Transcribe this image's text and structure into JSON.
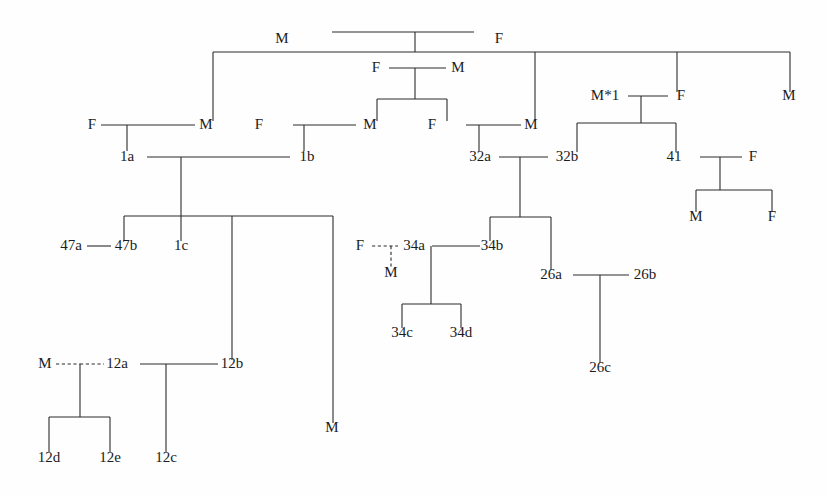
{
  "chart_data": {
    "type": "diagram",
    "diagram_kind": "pedigree-chart",
    "title": "",
    "background_color": "#fefefe",
    "line_color": "#2b2b2b",
    "text_color": "#1c1c1c",
    "legend": {
      "solid_line": "marriage / descent",
      "dashed_line": "non-marital or inferred union"
    },
    "nodes": [
      {
        "id": "n_g1_m",
        "label": "M",
        "x": 282,
        "y": 43,
        "generation": 1
      },
      {
        "id": "n_g1_f",
        "label": "F",
        "x": 499,
        "y": 43,
        "generation": 1
      },
      {
        "id": "n_g2_f_mid",
        "label": "F",
        "x": 376,
        "y": 72,
        "generation": 2
      },
      {
        "id": "n_g2_m_mid",
        "label": "M",
        "x": 458,
        "y": 72,
        "generation": 2
      },
      {
        "id": "n_g2_mstar",
        "label": "M*1",
        "x": 605,
        "y": 100,
        "generation": 2
      },
      {
        "id": "n_g2_f_r",
        "label": "F",
        "x": 681,
        "y": 100,
        "generation": 2
      },
      {
        "id": "n_g2_m_far",
        "label": "M",
        "x": 789,
        "y": 100,
        "generation": 2
      },
      {
        "id": "n_g3_f_a",
        "label": "F",
        "x": 92,
        "y": 129,
        "generation": 3
      },
      {
        "id": "n_g3_m_a",
        "label": "M",
        "x": 206,
        "y": 129,
        "generation": 3
      },
      {
        "id": "n_g3_f_b",
        "label": "F",
        "x": 259,
        "y": 129,
        "generation": 3
      },
      {
        "id": "n_g3_m_b",
        "label": "M",
        "x": 370,
        "y": 129,
        "generation": 3
      },
      {
        "id": "n_g3_f_c",
        "label": "F",
        "x": 432,
        "y": 129,
        "generation": 3
      },
      {
        "id": "n_g3_m_c",
        "label": "M",
        "x": 531,
        "y": 129,
        "generation": 3
      },
      {
        "id": "n_1a",
        "label": "1a",
        "x": 127,
        "y": 161,
        "generation": 4
      },
      {
        "id": "n_1b",
        "label": "1b",
        "x": 307,
        "y": 161,
        "generation": 4
      },
      {
        "id": "n_32a",
        "label": "32a",
        "x": 480,
        "y": 161,
        "generation": 4
      },
      {
        "id": "n_32b",
        "label": "32b",
        "x": 567,
        "y": 161,
        "generation": 4
      },
      {
        "id": "n_41",
        "label": "41",
        "x": 674,
        "y": 161,
        "generation": 4
      },
      {
        "id": "n_g4_f_r",
        "label": "F",
        "x": 753,
        "y": 161,
        "generation": 4
      },
      {
        "id": "n_g5_m_r",
        "label": "M",
        "x": 696,
        "y": 221,
        "generation": 5
      },
      {
        "id": "n_g5_f_r",
        "label": "F",
        "x": 772,
        "y": 221,
        "generation": 5
      },
      {
        "id": "n_47a",
        "label": "47a",
        "x": 71,
        "y": 250,
        "generation": 5
      },
      {
        "id": "n_47b",
        "label": "47b",
        "x": 126,
        "y": 250,
        "generation": 5
      },
      {
        "id": "n_1c",
        "label": "1c",
        "x": 181,
        "y": 250,
        "generation": 5
      },
      {
        "id": "n_34_f",
        "label": "F",
        "x": 360,
        "y": 250,
        "generation": 5
      },
      {
        "id": "n_34a",
        "label": "34a",
        "x": 414,
        "y": 250,
        "generation": 5
      },
      {
        "id": "n_34b",
        "label": "34b",
        "x": 492,
        "y": 250,
        "generation": 5
      },
      {
        "id": "n_34_m",
        "label": "M",
        "x": 391,
        "y": 277,
        "generation": 6
      },
      {
        "id": "n_26a",
        "label": "26a",
        "x": 551,
        "y": 279,
        "generation": 6
      },
      {
        "id": "n_26b",
        "label": "26b",
        "x": 645,
        "y": 279,
        "generation": 6
      },
      {
        "id": "n_34c",
        "label": "34c",
        "x": 402,
        "y": 337,
        "generation": 7
      },
      {
        "id": "n_34d",
        "label": "34d",
        "x": 461,
        "y": 337,
        "generation": 7
      },
      {
        "id": "n_26c",
        "label": "26c",
        "x": 600,
        "y": 372,
        "generation": 7
      },
      {
        "id": "n_12_m",
        "label": "M",
        "x": 45,
        "y": 368,
        "generation": 7
      },
      {
        "id": "n_12a",
        "label": "12a",
        "x": 117,
        "y": 368,
        "generation": 7
      },
      {
        "id": "n_12b",
        "label": "12b",
        "x": 232,
        "y": 368,
        "generation": 7
      },
      {
        "id": "n_g7_m_far",
        "label": "M",
        "x": 332,
        "y": 432,
        "generation": 7
      },
      {
        "id": "n_12d",
        "label": "12d",
        "x": 49,
        "y": 462,
        "generation": 8
      },
      {
        "id": "n_12e",
        "label": "12e",
        "x": 110,
        "y": 462,
        "generation": 8
      },
      {
        "id": "n_12c",
        "label": "12c",
        "x": 166,
        "y": 462,
        "generation": 8
      }
    ],
    "unions": [
      {
        "id": "u_g1",
        "partners": [
          "n_g1_m",
          "n_g1_f"
        ],
        "style": "solid",
        "children": [
          "n_g3_m_a",
          "n_g3_m_c",
          "n_g2_mstar",
          "n_g2_m_far"
        ]
      },
      {
        "id": "u_mid",
        "partners": [
          "n_g2_f_mid",
          "n_g2_m_mid"
        ],
        "style": "solid",
        "children": [
          "n_g3_m_b",
          "n_g3_f_c"
        ]
      },
      {
        "id": "u_star",
        "partners": [
          "n_g2_mstar",
          "n_g2_f_r"
        ],
        "style": "solid",
        "children": [
          "n_32b",
          "n_41"
        ]
      },
      {
        "id": "u_1a",
        "partners": [
          "n_g3_f_a",
          "n_g3_m_a"
        ],
        "style": "solid",
        "children": [
          "n_1a"
        ]
      },
      {
        "id": "u_1b",
        "partners": [
          "n_g3_f_b",
          "n_g3_m_b"
        ],
        "style": "solid",
        "children": [
          "n_1b"
        ]
      },
      {
        "id": "u_32a",
        "partners": [
          "n_g3_f_c",
          "n_g3_m_c"
        ],
        "style": "solid",
        "children": [
          "n_32a"
        ]
      },
      {
        "id": "u_1a1b",
        "partners": [
          "n_1a",
          "n_1b"
        ],
        "style": "solid",
        "children": [
          "n_47b",
          "n_1c",
          "n_12b",
          "n_g7_m_far"
        ]
      },
      {
        "id": "u_32ab",
        "partners": [
          "n_32a",
          "n_32b"
        ],
        "style": "solid",
        "children": [
          "n_34b",
          "n_26a"
        ]
      },
      {
        "id": "u_41f",
        "partners": [
          "n_41",
          "n_g4_f_r"
        ],
        "style": "solid",
        "children": [
          "n_g5_m_r",
          "n_g5_f_r"
        ]
      },
      {
        "id": "u_47",
        "partners": [
          "n_47a",
          "n_47b"
        ],
        "style": "solid",
        "children": []
      },
      {
        "id": "u_34",
        "partners": [
          "n_34a",
          "n_34b"
        ],
        "style": "solid",
        "children": [
          "n_34c",
          "n_34d"
        ]
      },
      {
        "id": "u_34f",
        "partners": [
          "n_34_f",
          "n_34a"
        ],
        "style": "dashed",
        "children": [
          "n_34_m"
        ]
      },
      {
        "id": "u_26",
        "partners": [
          "n_26a",
          "n_26b"
        ],
        "style": "solid",
        "children": [
          "n_26c"
        ]
      },
      {
        "id": "u_12",
        "partners": [
          "n_12_m",
          "n_12a"
        ],
        "style": "dashed",
        "children": [
          "n_12d",
          "n_12e"
        ]
      },
      {
        "id": "u_12b",
        "partners": [
          "n_12b"
        ],
        "style": "solid",
        "children": [
          "n_12c"
        ]
      }
    ],
    "labels_flat": [
      "M",
      "F",
      "F",
      "M",
      "M*1",
      "F",
      "M",
      "F",
      "M",
      "F",
      "M",
      "F",
      "M",
      "1a",
      "1b",
      "32a",
      "32b",
      "41",
      "F",
      "M",
      "F",
      "47a",
      "47b",
      "1c",
      "F",
      "34a",
      "34b",
      "M",
      "26a",
      "26b",
      "34c",
      "34d",
      "26c",
      "M",
      "12a",
      "12b",
      "M",
      "12d",
      "12e",
      "12c"
    ],
    "segments": [
      {
        "name": "g1-couple-bar",
        "kind": "h",
        "x1": 332,
        "x2": 474,
        "y": 32
      },
      {
        "name": "g1-union-drop",
        "kind": "v",
        "x": 415,
        "y1": 32,
        "y2": 52
      },
      {
        "name": "g1-sibship-bar",
        "kind": "h",
        "x1": 213,
        "x2": 790,
        "y": 52
      },
      {
        "name": "g1-child-drop-1",
        "kind": "v",
        "x": 213,
        "y1": 52,
        "y2": 121
      },
      {
        "name": "g1-child-drop-2",
        "kind": "v",
        "x": 535,
        "y1": 52,
        "y2": 121
      },
      {
        "name": "g1-child-drop-3",
        "kind": "v",
        "x": 677,
        "y1": 52,
        "y2": 92
      },
      {
        "name": "g1-child-drop-4",
        "kind": "v",
        "x": 790,
        "y1": 52,
        "y2": 92
      },
      {
        "name": "mid-couple-bar",
        "kind": "h",
        "x1": 389,
        "x2": 446,
        "y": 68
      },
      {
        "name": "mid-union-drop",
        "kind": "v",
        "x": 415,
        "y1": 68,
        "y2": 99
      },
      {
        "name": "mid-sibship-bar",
        "kind": "h",
        "x1": 377,
        "x2": 447,
        "y": 99
      },
      {
        "name": "mid-child-drop-l",
        "kind": "v",
        "x": 377,
        "y1": 99,
        "y2": 121
      },
      {
        "name": "mid-child-drop-r",
        "kind": "v",
        "x": 447,
        "y1": 99,
        "y2": 121
      },
      {
        "name": "star-couple-bar",
        "kind": "h",
        "x1": 628,
        "x2": 668,
        "y": 96
      },
      {
        "name": "star-union-drop",
        "kind": "v",
        "x": 641,
        "y1": 96,
        "y2": 123
      },
      {
        "name": "star-sibship-bar",
        "kind": "h",
        "x1": 577,
        "x2": 676,
        "y": 123
      },
      {
        "name": "star-child-drop-l",
        "kind": "v",
        "x": 577,
        "y1": 123,
        "y2": 152
      },
      {
        "name": "star-child-drop-r",
        "kind": "v",
        "x": 676,
        "y1": 123,
        "y2": 152
      },
      {
        "name": "u1a-couple-bar",
        "kind": "h",
        "x1": 101,
        "x2": 195,
        "y": 125
      },
      {
        "name": "u1a-child-drop",
        "kind": "v",
        "x": 127,
        "y1": 125,
        "y2": 151
      },
      {
        "name": "u1b-couple-bar",
        "kind": "h",
        "x1": 293,
        "x2": 356,
        "y": 125
      },
      {
        "name": "u1b-child-drop",
        "kind": "v",
        "x": 304,
        "y1": 125,
        "y2": 151
      },
      {
        "name": "u32a-couple-bar",
        "kind": "h",
        "x1": 466,
        "x2": 521,
        "y": 125
      },
      {
        "name": "u32a-child-drop",
        "kind": "v",
        "x": 479,
        "y1": 125,
        "y2": 151
      },
      {
        "name": "u1a1b-couple-bar",
        "kind": "h",
        "x1": 147,
        "x2": 290,
        "y": 157
      },
      {
        "name": "u1a1b-union-drop",
        "kind": "v",
        "x": 181,
        "y1": 157,
        "y2": 216
      },
      {
        "name": "u1a1b-sibship-bar",
        "kind": "h",
        "x1": 124,
        "x2": 333,
        "y": 216
      },
      {
        "name": "u1a1b-drop-47b",
        "kind": "v",
        "x": 124,
        "y1": 216,
        "y2": 241
      },
      {
        "name": "u1a1b-drop-1c",
        "kind": "v",
        "x": 181,
        "y1": 216,
        "y2": 241
      },
      {
        "name": "u1a1b-drop-12b",
        "kind": "v",
        "x": 232,
        "y1": 216,
        "y2": 360
      },
      {
        "name": "u1a1b-drop-m",
        "kind": "v",
        "x": 333,
        "y1": 216,
        "y2": 423
      },
      {
        "name": "u32ab-couple-bar",
        "kind": "h",
        "x1": 499,
        "x2": 548,
        "y": 157
      },
      {
        "name": "u32ab-union-drop",
        "kind": "v",
        "x": 520,
        "y1": 157,
        "y2": 217
      },
      {
        "name": "u32ab-sibship-bar",
        "kind": "h",
        "x1": 490,
        "x2": 551,
        "y": 217
      },
      {
        "name": "u32ab-drop-34b",
        "kind": "v",
        "x": 490,
        "y1": 217,
        "y2": 241
      },
      {
        "name": "u32ab-drop-26a",
        "kind": "v",
        "x": 551,
        "y1": 217,
        "y2": 270
      },
      {
        "name": "u41f-couple-bar",
        "kind": "h",
        "x1": 700,
        "x2": 742,
        "y": 157
      },
      {
        "name": "u41f-union-drop",
        "kind": "v",
        "x": 720,
        "y1": 157,
        "y2": 190
      },
      {
        "name": "u41f-sibship-bar",
        "kind": "h",
        "x1": 696,
        "x2": 772,
        "y": 190
      },
      {
        "name": "u41f-drop-m",
        "kind": "v",
        "x": 696,
        "y1": 190,
        "y2": 212
      },
      {
        "name": "u41f-drop-f",
        "kind": "v",
        "x": 772,
        "y1": 190,
        "y2": 212
      },
      {
        "name": "u47-couple-bar",
        "kind": "h",
        "x1": 87,
        "x2": 111,
        "y": 246
      },
      {
        "name": "u34-couple-bar",
        "kind": "h",
        "x1": 432,
        "x2": 480,
        "y": 246
      },
      {
        "name": "u34-union-drop",
        "kind": "v",
        "x": 431,
        "y1": 246,
        "y2": 304
      },
      {
        "name": "u34-sibship-bar",
        "kind": "h",
        "x1": 402,
        "x2": 461,
        "y": 304
      },
      {
        "name": "u34-drop-34c",
        "kind": "v",
        "x": 402,
        "y1": 304,
        "y2": 328
      },
      {
        "name": "u34-drop-34d",
        "kind": "v",
        "x": 461,
        "y1": 304,
        "y2": 328
      },
      {
        "name": "u26-couple-bar",
        "kind": "h",
        "x1": 573,
        "x2": 629,
        "y": 275
      },
      {
        "name": "u26-child-drop",
        "kind": "v",
        "x": 600,
        "y1": 275,
        "y2": 363
      },
      {
        "name": "u12-union-drop",
        "kind": "v",
        "x": 80,
        "y1": 364,
        "y2": 417
      },
      {
        "name": "u12-sibship-bar",
        "kind": "h",
        "x1": 49,
        "x2": 110,
        "y": 417
      },
      {
        "name": "u12-drop-12d",
        "kind": "v",
        "x": 49,
        "y1": 417,
        "y2": 452
      },
      {
        "name": "u12-drop-12e",
        "kind": "v",
        "x": 110,
        "y1": 417,
        "y2": 452
      },
      {
        "name": "u12b-couple-bar",
        "kind": "h",
        "x1": 140,
        "x2": 218,
        "y": 364
      },
      {
        "name": "u12b-child-drop",
        "kind": "v",
        "x": 166,
        "y1": 364,
        "y2": 452
      }
    ],
    "dashed_segments": [
      {
        "name": "u34f-dashed-bar",
        "kind": "h",
        "x1": 372,
        "x2": 398,
        "y": 246
      },
      {
        "name": "u34f-dashed-drop",
        "kind": "v",
        "x": 391,
        "y1": 246,
        "y2": 268
      },
      {
        "name": "u12-dashed-left",
        "kind": "h",
        "x1": 56,
        "x2": 80,
        "y": 364
      },
      {
        "name": "u12-dashed-right",
        "kind": "h",
        "x1": 80,
        "x2": 104,
        "y": 364
      }
    ]
  }
}
